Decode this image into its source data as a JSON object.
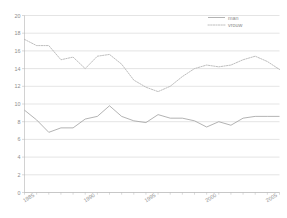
{
  "chart_data": {
    "type": "line",
    "title": "",
    "xlabel": "",
    "ylabel": "",
    "ylim": [
      0,
      20
    ],
    "xlim": [
      1985,
      2006
    ],
    "yticks": [
      0,
      2,
      4,
      6,
      8,
      10,
      12,
      14,
      16,
      18,
      20
    ],
    "ytick_labels": [
      "0",
      "2",
      "4",
      "6",
      "8",
      "10",
      "12",
      "14",
      "16",
      "18",
      "20"
    ],
    "xticks": [
      1985,
      1990,
      1995,
      2000,
      2005
    ],
    "xtick_labels": [
      "1985",
      "1990",
      "1995",
      "2000",
      "2005"
    ],
    "grid": true,
    "grid_axis": "y",
    "legend_position": "top-right",
    "x": [
      1985,
      1986,
      1987,
      1988,
      1989,
      1990,
      1991,
      1992,
      1993,
      1994,
      1995,
      1996,
      1997,
      1998,
      1999,
      2000,
      2001,
      2002,
      2003,
      2004,
      2005,
      2006
    ],
    "series": [
      {
        "name": "man",
        "style": "solid",
        "color": "#9a9a9a",
        "values": [
          9.3,
          8.2,
          6.8,
          7.3,
          7.3,
          8.3,
          8.6,
          9.8,
          8.6,
          8.1,
          7.9,
          8.8,
          8.4,
          8.4,
          8.1,
          7.4,
          8.0,
          7.6,
          8.4,
          8.6,
          8.6,
          8.6
        ]
      },
      {
        "name": "vrouw",
        "style": "dotted",
        "color": "#a8a8a8",
        "values": [
          17.3,
          16.6,
          16.6,
          15.0,
          15.3,
          14.0,
          15.4,
          15.6,
          14.5,
          12.7,
          11.9,
          11.4,
          12.0,
          13.1,
          14.0,
          14.4,
          14.2,
          14.4,
          15.0,
          15.4,
          14.8,
          13.9
        ]
      }
    ]
  },
  "legend": {
    "entries": [
      {
        "label": "man"
      },
      {
        "label": "vrouw"
      }
    ]
  }
}
